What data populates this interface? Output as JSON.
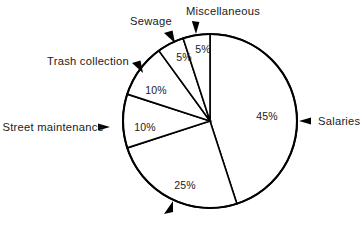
{
  "chart_data": {
    "type": "pie",
    "title": "",
    "subtitle": "",
    "xlabel": "",
    "ylabel": "",
    "grid": false,
    "legend_position": "callout-labels",
    "total": 100,
    "units": "percent",
    "start_angle_deg": 0,
    "direction": "clockwise",
    "categories": [
      "Salaries",
      "",
      "Street maintenance",
      "Trash collection",
      "Sewage",
      "Miscellaneous"
    ],
    "values": [
      45,
      25,
      10,
      10,
      5,
      5
    ],
    "slices": [
      {
        "name": "Salaries",
        "label": "Salaries",
        "has_name_label": true,
        "value": 45,
        "value_label": "45%",
        "start_deg": 0,
        "end_deg": 162,
        "value_label_x": 267,
        "value_label_y": 120,
        "callout_text_x": 318,
        "callout_text_y": 125,
        "callout_anchor": "start",
        "arrow_type": "left-triangle",
        "arrow_x": 299,
        "arrow_y": 121
      },
      {
        "name": "",
        "label": "",
        "has_name_label": false,
        "value": 25,
        "value_label": "25%",
        "start_deg": 162,
        "end_deg": 252,
        "value_label_x": 185,
        "value_label_y": 189,
        "callout_text_x": 0,
        "callout_text_y": 0,
        "callout_anchor": "middle",
        "arrow_type": "up-right-barb",
        "arrow_x": 163,
        "arrow_y": 213
      },
      {
        "name": "Street maintenance",
        "label": "Street maintenance",
        "has_name_label": true,
        "value": 10,
        "value_label": "10%",
        "start_deg": 252,
        "end_deg": 288,
        "value_label_x": 145,
        "value_label_y": 131,
        "callout_text_x": 104,
        "callout_text_y": 131,
        "callout_anchor": "end",
        "arrow_type": "right-triangle",
        "arrow_x": 110,
        "arrow_y": 127
      },
      {
        "name": "Trash collection",
        "label": "Trash collection",
        "has_name_label": true,
        "value": 10,
        "value_label": "10%",
        "start_deg": 288,
        "end_deg": 324,
        "value_label_x": 156,
        "value_label_y": 94,
        "callout_text_x": 129,
        "callout_text_y": 65,
        "callout_anchor": "end",
        "arrow_type": "down-right-barb",
        "arrow_x": 133,
        "arrow_y": 62
      },
      {
        "name": "Sewage",
        "label": "Sewage",
        "has_name_label": true,
        "value": 5,
        "value_label": "5%",
        "start_deg": 324,
        "end_deg": 342,
        "value_label_x": 184,
        "value_label_y": 61,
        "callout_text_x": 172,
        "callout_text_y": 25,
        "callout_anchor": "end",
        "arrow_type": "down-right-barb",
        "arrow_x": 165,
        "arrow_y": 32
      },
      {
        "name": "Miscellaneous",
        "label": "Miscellaneous",
        "has_name_label": true,
        "value": 5,
        "value_label": "5%",
        "start_deg": 342,
        "end_deg": 360,
        "value_label_x": 203,
        "value_label_y": 53,
        "callout_text_x": 223,
        "callout_text_y": 15,
        "callout_anchor": "middle",
        "arrow_type": "down-barb",
        "arrow_x": 196,
        "arrow_y": 24
      }
    ],
    "colors": {
      "slice_fill": "#ffffff",
      "slice_stroke": "#000000",
      "text": "#1a1a1a",
      "background": "#ffffff"
    },
    "geometry": {
      "center_x": 210,
      "center_y": 121,
      "radius": 87
    }
  }
}
